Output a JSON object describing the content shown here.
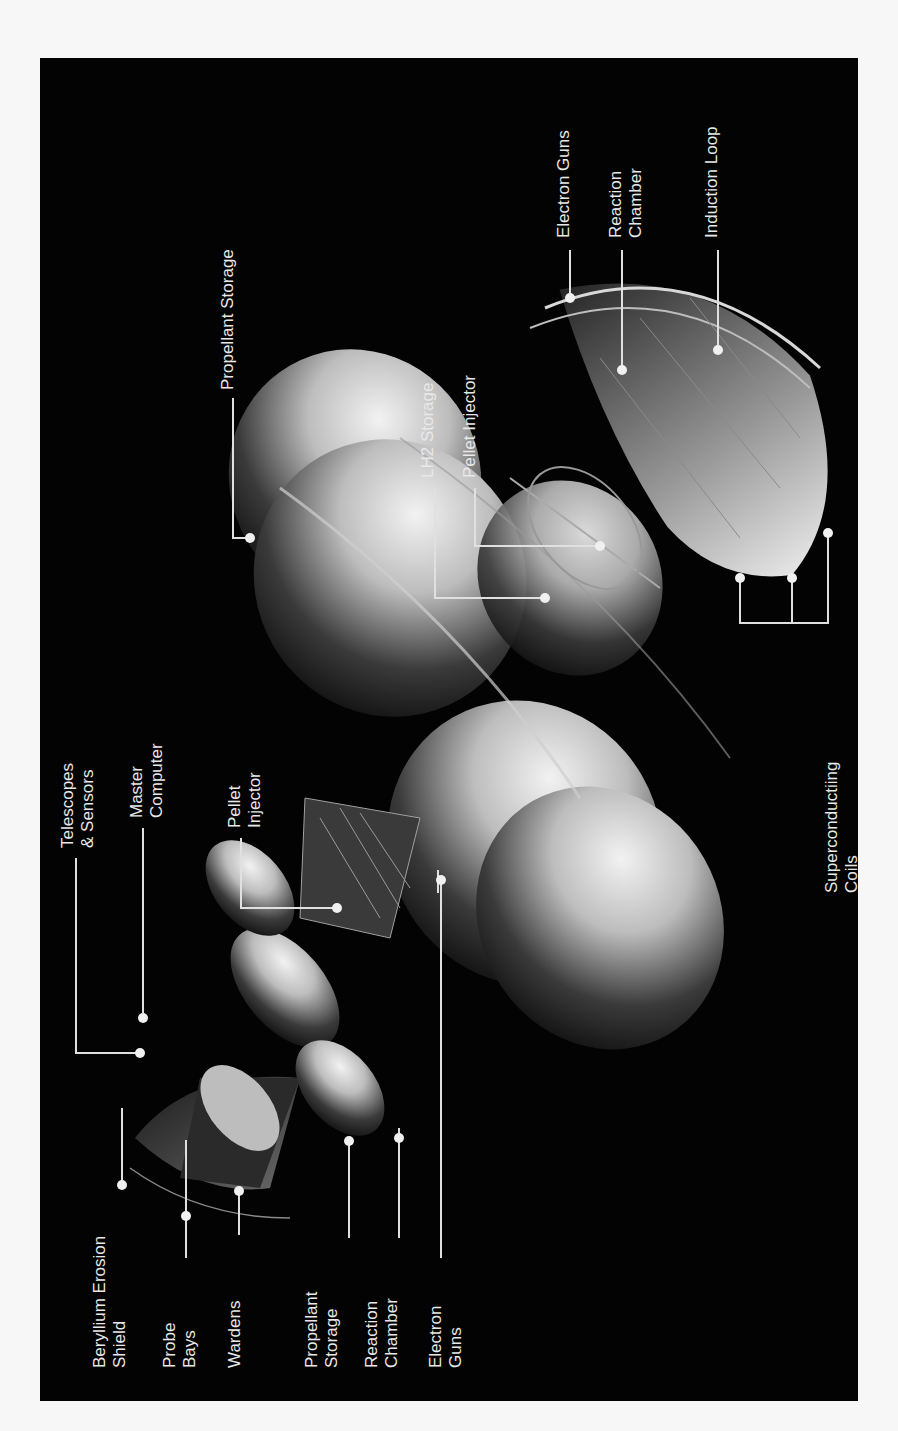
{
  "figure": {
    "background_color": "#030303",
    "label_color": "#e8e8e8",
    "page_color": "#f7f7f7"
  },
  "labels": {
    "beryllium_erosion_shield": "Beryllium Erosion\nShield",
    "probe_bays": "Probe\nBays",
    "wardens": "Wardens",
    "propellant_storage_front": "Propellant\nStorage",
    "reaction_chamber_front": "Reaction\nChamber",
    "electron_guns_front": "Electron\nGuns",
    "telescopes_sensors": "Telescopes\n& Sensors",
    "master_computer": "Master\nComputer",
    "pellet_injector_front": "Pellet\nInjector",
    "superconducting_coils": "Superconductiing\nCoils",
    "propellant_storage_main": "Propellant Storage",
    "lh2_storage": "LH2 Storage",
    "pellet_injector_main": "Pellet Injector",
    "electron_guns_main": "Electron Guns",
    "reaction_chamber_main": "Reaction\nChamber",
    "induction_loop": "Induction Loop"
  }
}
